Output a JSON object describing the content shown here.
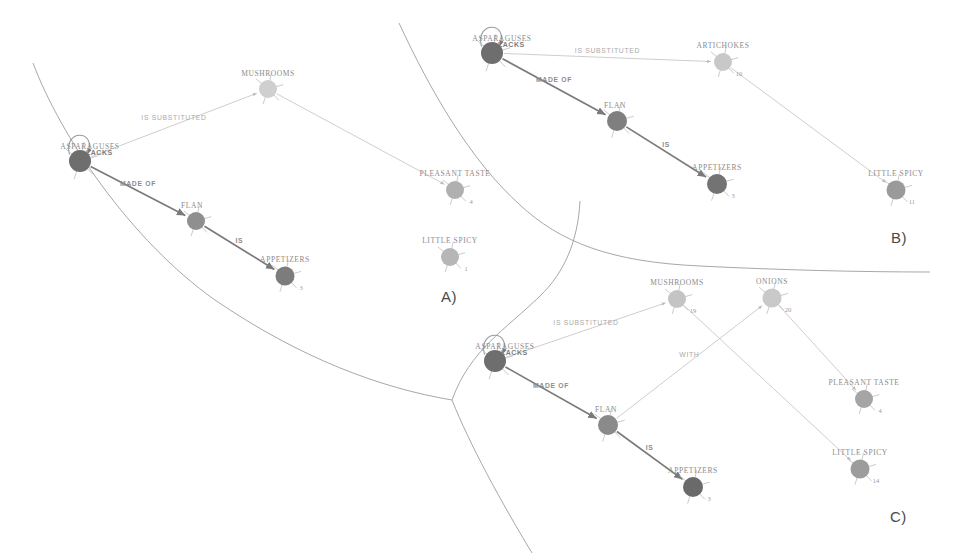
{
  "figure": {
    "background": "#ffffff",
    "panels": [
      {
        "id": "A",
        "label": "A)",
        "x": 448,
        "y": 297
      },
      {
        "id": "B",
        "label": "B)",
        "x": 898,
        "y": 238
      },
      {
        "id": "C",
        "label": "C)",
        "x": 897,
        "y": 517
      }
    ]
  },
  "colors": {
    "node_dark": "#6e6e6e",
    "node_mid": "#8f8f8f",
    "node_light": "#b9b9b9",
    "node_pale": "#cfcfcf",
    "edge_dark": "#7a7a7a",
    "edge_light": "#c2c2c2",
    "text_gray": "#8a8a8a",
    "region_stroke": "#9d9d9d",
    "panel_letter": "#4a4a4a"
  },
  "panel_a": {
    "letter": "A)",
    "nodes": [
      {
        "id": "asparaguses",
        "label": "ASPARAGUSES",
        "count": "",
        "x": 80,
        "y": 161,
        "r": 11,
        "color": "#6e6e6e",
        "label_dx": 10,
        "label_dy": -12,
        "count_dx": 0,
        "count_dy": 0
      },
      {
        "id": "mushrooms",
        "label": "MUSHROOMS",
        "count": "",
        "x": 268,
        "y": 89,
        "r": 9,
        "color": "#cfcfcf",
        "label_dx": 0,
        "label_dy": -13,
        "count_dx": 0,
        "count_dy": 0
      },
      {
        "id": "flan",
        "label": "FLAN",
        "count": "",
        "x": 196,
        "y": 221,
        "r": 9,
        "color": "#8f8f8f",
        "label_dx": -4,
        "label_dy": -13,
        "count_dx": 0,
        "count_dy": 0
      },
      {
        "id": "appetizers",
        "label": "APPETIZERS",
        "count": "3",
        "x": 285,
        "y": 276,
        "r": 9.5,
        "color": "#7c7c7c",
        "label_dx": 0,
        "label_dy": -14,
        "count_dx": 16,
        "count_dy": 14
      },
      {
        "id": "pleasant_taste",
        "label": "PLEASANT TASTE",
        "count": "4",
        "x": 455,
        "y": 190,
        "r": 9,
        "color": "#b0b0b0",
        "label_dx": 0,
        "label_dy": -14,
        "count_dx": 16,
        "count_dy": 14
      },
      {
        "id": "little_spicy",
        "label": "LITTLE SPICY",
        "count": "1",
        "x": 450,
        "y": 257,
        "r": 9,
        "color": "#b6b6b6",
        "label_dx": 0,
        "label_dy": -14,
        "count_dx": 16,
        "count_dy": 14
      }
    ],
    "edges": [
      {
        "from": "asparaguses",
        "to": "mushrooms",
        "label": "IS SUBSTITUTED",
        "style": "light"
      },
      {
        "from": "asparaguses",
        "to": "flan",
        "label": "MADE OF",
        "style": "dark"
      },
      {
        "from": "flan",
        "to": "appetizers",
        "label": "IS",
        "style": "dark"
      },
      {
        "from": "mushrooms",
        "to": "pleasant_taste",
        "label": "",
        "style": "light"
      }
    ],
    "self_loop": {
      "node": "asparaguses",
      "label": "LACKS"
    }
  },
  "panel_b": {
    "letter": "B)",
    "nodes": [
      {
        "id": "asparaguses",
        "label": "ASPARAGUSES",
        "count": "",
        "x": 492,
        "y": 53,
        "r": 11,
        "color": "#6e6e6e",
        "label_dx": 10,
        "label_dy": -12,
        "count_dx": 0,
        "count_dy": 0
      },
      {
        "id": "artichokes",
        "label": "ARTICHOKES",
        "count": "10",
        "x": 723,
        "y": 62,
        "r": 9,
        "color": "#c8c8c8",
        "label_dx": 0,
        "label_dy": -14,
        "count_dx": 16,
        "count_dy": 14
      },
      {
        "id": "flan",
        "label": "FLAN",
        "count": "",
        "x": 617,
        "y": 121,
        "r": 10,
        "color": "#7f7f7f",
        "label_dx": -2,
        "label_dy": -13,
        "count_dx": 0,
        "count_dy": 0
      },
      {
        "id": "appetizers",
        "label": "APPETIZERS",
        "count": "3",
        "x": 717,
        "y": 184,
        "r": 10,
        "color": "#737373",
        "label_dx": 0,
        "label_dy": -14,
        "count_dx": 16,
        "count_dy": 14
      },
      {
        "id": "little_spicy",
        "label": "LITTLE SPICY",
        "count": "11",
        "x": 896,
        "y": 190,
        "r": 9.5,
        "color": "#9a9a9a",
        "label_dx": 0,
        "label_dy": -14,
        "count_dx": 16,
        "count_dy": 14
      }
    ],
    "edges": [
      {
        "from": "asparaguses",
        "to": "artichokes",
        "label": "IS SUBSTITUTED",
        "style": "light"
      },
      {
        "from": "asparaguses",
        "to": "flan",
        "label": "MADE OF",
        "style": "dark"
      },
      {
        "from": "flan",
        "to": "appetizers",
        "label": "IS",
        "style": "dark"
      },
      {
        "from": "artichokes",
        "to": "little_spicy",
        "label": "",
        "style": "light"
      }
    ],
    "self_loop": {
      "node": "asparaguses",
      "label": "LACKS"
    }
  },
  "panel_c": {
    "letter": "C)",
    "nodes": [
      {
        "id": "asparaguses",
        "label": "ASPARAGUSES",
        "count": "",
        "x": 495,
        "y": 361,
        "r": 11,
        "color": "#6e6e6e",
        "label_dx": 10,
        "label_dy": -12,
        "count_dx": 0,
        "count_dy": 0
      },
      {
        "id": "mushrooms",
        "label": "MUSHROOMS",
        "count": "19",
        "x": 677,
        "y": 299,
        "r": 9,
        "color": "#c4c4c4",
        "label_dx": 0,
        "label_dy": -14,
        "count_dx": 16,
        "count_dy": 14
      },
      {
        "id": "onions",
        "label": "ONIONS",
        "count": "20",
        "x": 772,
        "y": 298,
        "r": 9.5,
        "color": "#c9c9c9",
        "label_dx": 0,
        "label_dy": -14,
        "count_dx": 16,
        "count_dy": 14
      },
      {
        "id": "flan",
        "label": "FLAN",
        "count": "",
        "x": 608,
        "y": 425,
        "r": 10,
        "color": "#8a8a8a",
        "label_dx": -2,
        "label_dy": -13,
        "count_dx": 0,
        "count_dy": 0
      },
      {
        "id": "appetizers",
        "label": "APPETIZERS",
        "count": "3",
        "x": 693,
        "y": 487,
        "r": 10,
        "color": "#6a6a6a",
        "label_dx": 0,
        "label_dy": -14,
        "count_dx": 16,
        "count_dy": 14
      },
      {
        "id": "pleasant_taste",
        "label": "PLEASANT TASTE",
        "count": "4",
        "x": 864,
        "y": 399,
        "r": 9,
        "color": "#a5a5a5",
        "label_dx": 0,
        "label_dy": -14,
        "count_dx": 16,
        "count_dy": 14
      },
      {
        "id": "little_spicy",
        "label": "LITTLE SPICY",
        "count": "14",
        "x": 860,
        "y": 469,
        "r": 9.5,
        "color": "#9c9c9c",
        "label_dx": 0,
        "label_dy": -14,
        "count_dx": 16,
        "count_dy": 14
      }
    ],
    "edges": [
      {
        "from": "asparaguses",
        "to": "mushrooms",
        "label": "IS SUBSTITUTED",
        "style": "light"
      },
      {
        "from": "asparaguses",
        "to": "flan",
        "label": "MADE OF",
        "style": "dark"
      },
      {
        "from": "flan",
        "to": "appetizers",
        "label": "IS",
        "style": "dark"
      },
      {
        "from": "flan",
        "to": "onions",
        "label": "WITH",
        "style": "light"
      },
      {
        "from": "mushrooms",
        "to": "little_spicy",
        "label": "",
        "style": "light"
      },
      {
        "from": "onions",
        "to": "pleasant_taste",
        "label": "",
        "style": "light"
      }
    ],
    "self_loop": {
      "node": "asparaguses",
      "label": "LACKS"
    }
  },
  "region_boundaries": [
    {
      "name": "boundary-a-top",
      "d": "M 33 63 C 60 135 130 240 215 300 C 300 358 380 388 452 400"
    },
    {
      "name": "boundary-ab-divider",
      "d": "M 399 23 C 430 90 470 160 520 205 C 560 242 610 262 700 266"
    },
    {
      "name": "boundary-b-bottom",
      "d": "M 700 266 C 780 270 860 272 930 272"
    },
    {
      "name": "boundary-c-left",
      "d": "M 580 201 C 578 240 565 272 540 296 C 505 330 470 350 452 400"
    },
    {
      "name": "boundary-c-bottom",
      "d": "M 452 400 C 470 445 500 500 532 553"
    }
  ]
}
